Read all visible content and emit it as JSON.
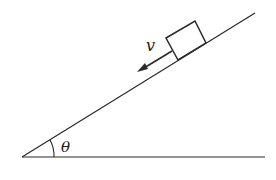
{
  "diagram": {
    "type": "inclined-plane",
    "labels": {
      "velocity": "v",
      "angle": "θ"
    },
    "colors": {
      "stroke": "#2a2a2a",
      "background": "#ffffff"
    }
  }
}
